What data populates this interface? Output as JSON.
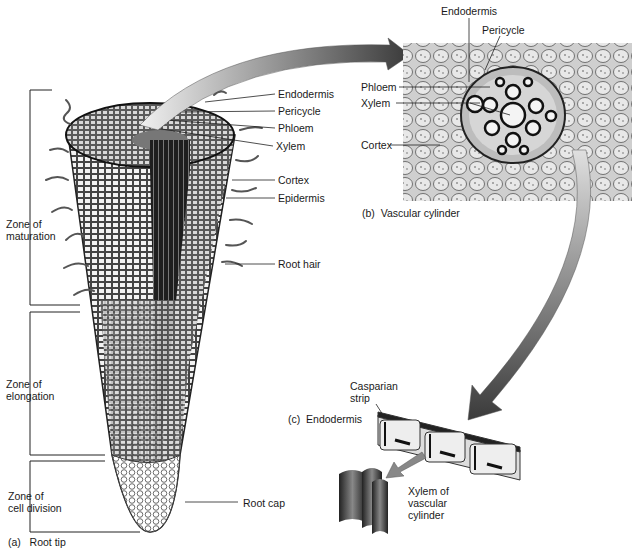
{
  "figure": {
    "panel_a": {
      "caption_letter": "(a)",
      "caption": "Root tip",
      "zones": [
        {
          "label_line1": "Zone of",
          "label_line2": "maturation"
        },
        {
          "label_line1": "Zone of",
          "label_line2": "elongation"
        },
        {
          "label_line1": "Zone of",
          "label_line2": "cell division"
        }
      ],
      "labels": {
        "endodermis": "Endodermis",
        "pericycle": "Pericycle",
        "phloem": "Phloem",
        "xylem": "Xylem",
        "cortex": "Cortex",
        "epidermis": "Epidermis",
        "root_hair": "Root hair",
        "root_cap": "Root cap"
      }
    },
    "panel_b": {
      "caption_letter": "(b)",
      "caption": "Vascular cylinder",
      "labels": {
        "endodermis": "Endodermis",
        "pericycle": "Pericycle",
        "phloem": "Phloem",
        "xylem": "Xylem",
        "cortex": "Cortex"
      }
    },
    "panel_c": {
      "caption_letter": "(c)",
      "caption": "Endodermis",
      "labels": {
        "casparian_line1": "Casparian",
        "casparian_line2": "strip",
        "xylem_line1": "Xylem of",
        "xylem_line2": "vascular",
        "xylem_line3": "cylinder"
      }
    },
    "colors": {
      "ink": "#1a1a1a",
      "arrow_dark": "#3a3a3a",
      "arrow_light": "#d8d8d8",
      "micrograph_bg": "#c9c9c9"
    }
  }
}
